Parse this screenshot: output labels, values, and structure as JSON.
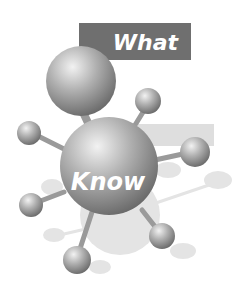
{
  "illustration": {
    "banner_text": "What",
    "hub_text": "Know",
    "colors": {
      "banner": "#6f6f6f",
      "band": "#dcdcdc",
      "sphere_light": "#e8e8e8",
      "sphere_mid": "#a9a9a9",
      "sphere_dark": "#6a6a6a",
      "ghost": "#e2e2e2",
      "background": "#ffffff"
    }
  }
}
